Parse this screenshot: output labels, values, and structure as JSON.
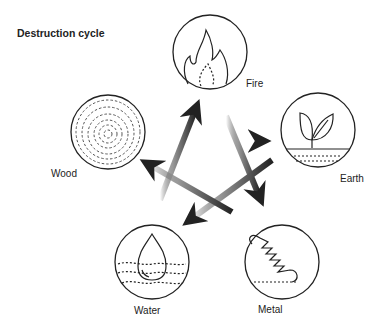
{
  "title": "Destruction cycle",
  "elements": [
    {
      "name": "Fire",
      "icon": "flame-icon"
    },
    {
      "name": "Earth",
      "icon": "sprout-icon"
    },
    {
      "name": "Metal",
      "icon": "spring-icon"
    },
    {
      "name": "Water",
      "icon": "droplet-icon"
    },
    {
      "name": "Wood",
      "icon": "tree-rings-icon"
    }
  ],
  "cycle": [
    {
      "from": "Fire",
      "to": "Metal"
    },
    {
      "from": "Metal",
      "to": "Wood"
    },
    {
      "from": "Wood",
      "to": "Earth"
    },
    {
      "from": "Earth",
      "to": "Water"
    },
    {
      "from": "Water",
      "to": "Fire"
    }
  ],
  "colors": {
    "stroke": "#222222",
    "arrow_dark": "#2a2a2a"
  }
}
